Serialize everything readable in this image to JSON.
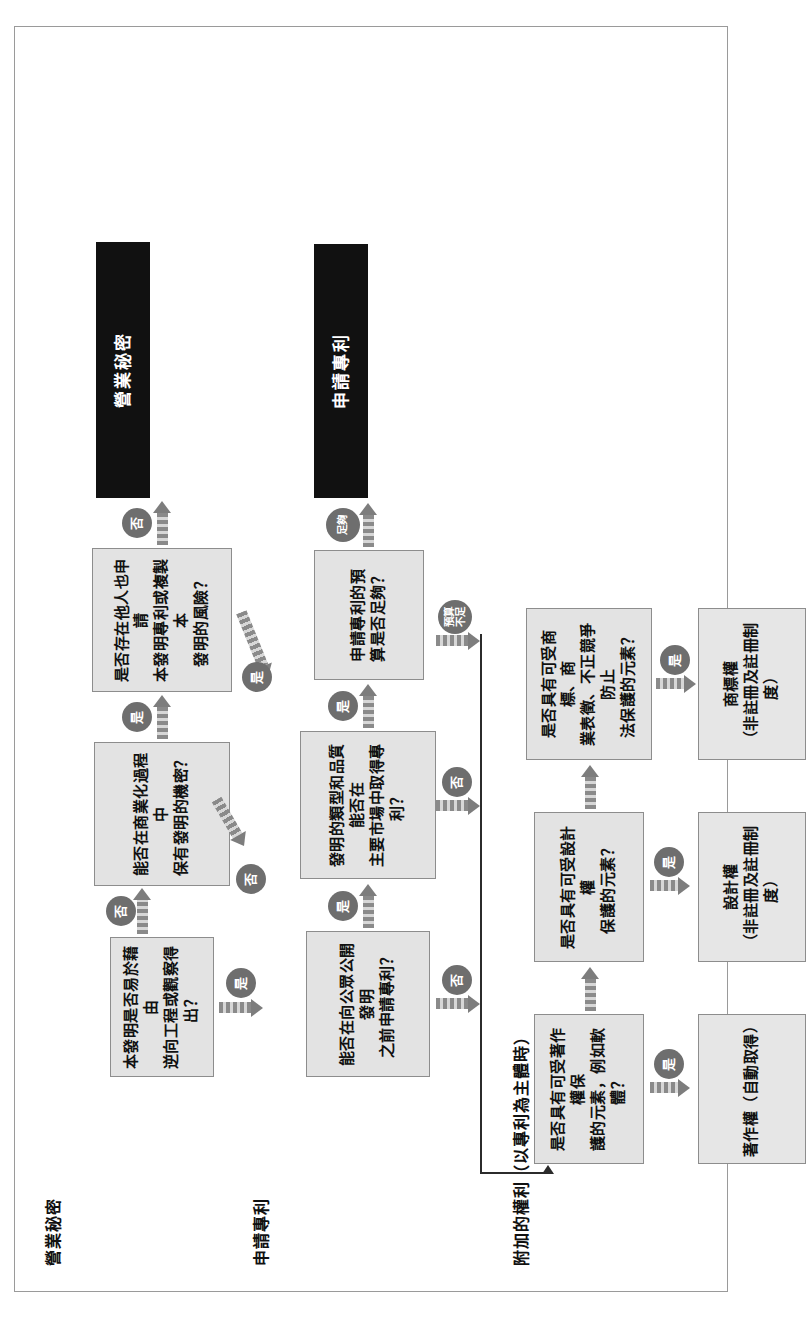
{
  "diagram": {
    "type": "flowchart",
    "orientation": "rotated-90-ccw",
    "colors": {
      "node_fill": "#e3e3e3",
      "node_border": "#8d8d8d",
      "result_fill": "#111111",
      "result_text": "#ffffff",
      "bubble_fill": "#6e6e6e",
      "arrow_fill": "#7d7d7d",
      "frame_border": "#9a9a9a"
    },
    "sections": [
      {
        "id": "trade-secret",
        "label": "營業秘密"
      },
      {
        "id": "patent",
        "label": "申請專利"
      },
      {
        "id": "additional-rights",
        "label": "附加的權利（以專利為主體時）"
      }
    ],
    "nodes": {
      "reverse_engineering": "本發明是否易於藉由\n逆向工程或觀察得出？",
      "keep_secret": "能否在商業化過程中\n保有發明的機密？",
      "third_party_risk": "是否存在他人也申請\n本發明專利或複製本\n發明的風險？",
      "file_before_disclosure": "能否在向公眾公開發明\n之前申請專利？",
      "patentable_quality": "發明的類型和品質能否在\n主要市場中取得專利？",
      "budget_enough": "申請專利的預\n算是否足夠？",
      "copyright_elements": "是否具有可受著作權保\n護的元素，例如軟體？",
      "design_right_elements": "是否具有可受設計權\n保護的元素？",
      "trademark_elements": "是否具有可受商標、商\n業表徵、不正競爭防止\n法保護的元素？"
    },
    "results": {
      "trade_secret": "營業秘密",
      "patent": "申請專利"
    },
    "outcomes": {
      "copyright": "著作權（自動取得）",
      "design_right": "設計權\n（非註冊及註冊制度）",
      "trademark": "商標權\n（非註冊及註冊制度）"
    },
    "edge_labels": {
      "re_yes": "是",
      "re_no": "否",
      "keep_secret_no": "否",
      "keep_secret_yes": "是",
      "third_party_yes": "是",
      "third_party_no": "否",
      "file_before_yes": "是",
      "file_before_no": "否",
      "quality_yes": "是",
      "quality_no": "否",
      "budget_enough_yes": "足夠",
      "budget_not_enough": "預算\n不足",
      "copyright_yes": "是",
      "design_yes": "是",
      "trademark_yes": "是"
    }
  }
}
